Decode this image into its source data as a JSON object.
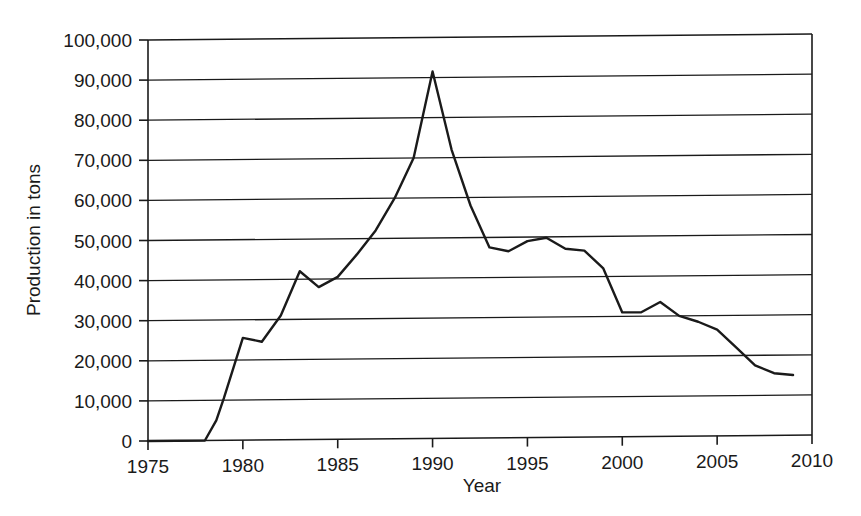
{
  "chart_data": {
    "type": "line",
    "title": "",
    "xlabel": "Year",
    "ylabel": "Production in tons",
    "xlim": [
      1975,
      2010
    ],
    "ylim": [
      0,
      100000
    ],
    "grid": true,
    "legend": "none",
    "xticks": [
      1975,
      1980,
      1985,
      1990,
      1995,
      2000,
      2005,
      2010
    ],
    "xtick_labels": [
      "1975",
      "1980",
      "1985",
      "1990",
      "1995",
      "2000",
      "2005",
      "2010"
    ],
    "yticks": [
      0,
      10000,
      20000,
      30000,
      40000,
      50000,
      60000,
      70000,
      80000,
      90000,
      100000
    ],
    "ytick_labels": [
      "0",
      "10,000",
      "20,000",
      "30,000",
      "40,000",
      "50,000",
      "60,000",
      "70,000",
      "80,000",
      "90,000",
      "100,000"
    ],
    "line_color": "#1a1a1a",
    "series": [
      {
        "name": "Production",
        "x": [
          1975,
          1978,
          1978.6,
          1979,
          1980,
          1981,
          1982,
          1983,
          1984,
          1985,
          1986,
          1987,
          1988,
          1989,
          1990,
          1991,
          1992,
          1993,
          1994,
          1995,
          1996,
          1997,
          1998,
          1999,
          2000,
          2001,
          2002,
          2003,
          2004,
          2005,
          2006,
          2007,
          2008,
          2009
        ],
        "values": [
          0,
          0,
          5000,
          10500,
          25500,
          24500,
          31000,
          42000,
          38000,
          40500,
          46000,
          52000,
          60000,
          70000,
          91500,
          72000,
          58000,
          47500,
          46500,
          49000,
          49800,
          47000,
          46500,
          42000,
          31000,
          31000,
          33500,
          30000,
          28500,
          26500,
          22000,
          17500,
          15500,
          15000
        ]
      }
    ]
  }
}
